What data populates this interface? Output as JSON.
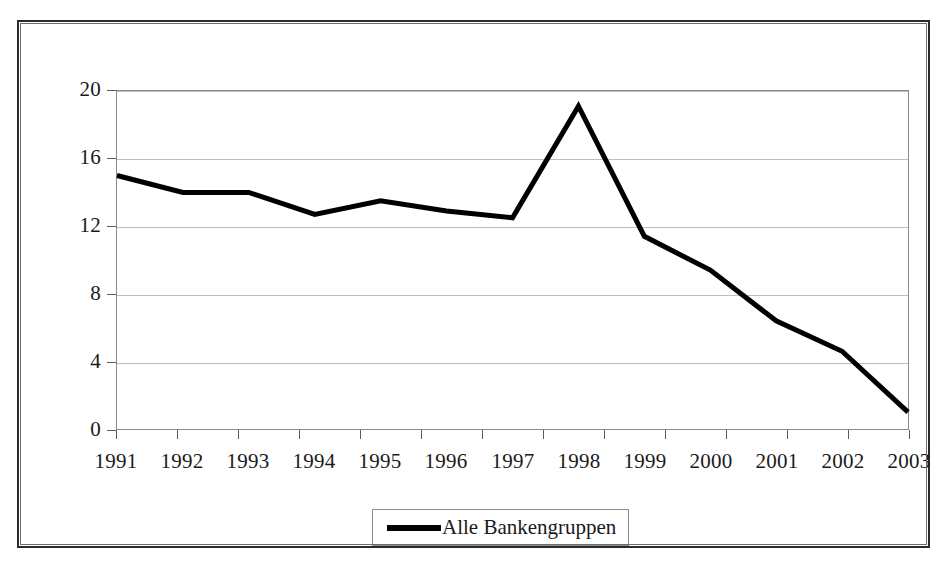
{
  "chart_data": {
    "type": "line",
    "title": "",
    "subtitle": "",
    "xlabel": "",
    "ylabel": "",
    "categories": [
      "1991",
      "1992",
      "1993",
      "1994",
      "1995",
      "1996",
      "1997",
      "1998",
      "1999",
      "2000",
      "2001",
      "2002",
      "2003"
    ],
    "series": [
      {
        "name": "Alle Bankengruppen",
        "color": "#000000",
        "values": [
          15.0,
          14.0,
          14.0,
          12.7,
          13.5,
          12.9,
          12.5,
          19.1,
          11.4,
          9.4,
          6.4,
          4.6,
          1.0
        ]
      }
    ],
    "ylim": [
      0,
      20
    ],
    "yticks": [
      0,
      4,
      8,
      12,
      16,
      20
    ],
    "ytick_labels": [
      "0",
      "4",
      "8",
      "12",
      "16",
      "20"
    ],
    "grid": "horizontal",
    "legend_position": "bottom-center",
    "line_width": 5,
    "annotations": []
  },
  "legend": {
    "entries": [
      {
        "label": "Alle Bankengruppen",
        "swatch": "line-swatch",
        "color": "#000000"
      }
    ]
  },
  "axes": {
    "y_tick_labels": [
      "20",
      "16",
      "12",
      "8",
      "4",
      "0"
    ],
    "x_tick_labels": [
      "1991",
      "1992",
      "1993",
      "1994",
      "1995",
      "1996",
      "1997",
      "1998",
      "1999",
      "2000",
      "2001",
      "2002",
      "2003"
    ]
  },
  "colors": {
    "line": "#000000",
    "gridline": "#bdbdbd",
    "plot_border": "#8a8a8a",
    "outer_border": "#2b2b2b",
    "text": "#1a1a1a",
    "background": "#ffffff"
  }
}
